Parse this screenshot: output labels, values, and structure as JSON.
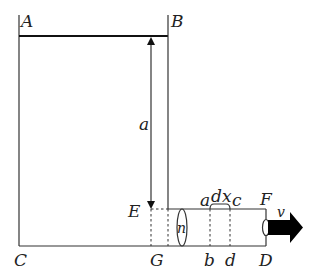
{
  "diagram": {
    "points": {
      "A": "A",
      "B": "B",
      "C": "C",
      "D": "D",
      "E": "E",
      "F": "F",
      "G": "G"
    },
    "labels": {
      "height": "a",
      "section_top_left": "a",
      "section_top_right": "c",
      "section_bottom_left": "b",
      "section_bottom_right": "d",
      "element_width": "dx",
      "cross_section": "n",
      "velocity": "v"
    },
    "colors": {
      "line": "#333333",
      "arrow": "#000000"
    }
  }
}
